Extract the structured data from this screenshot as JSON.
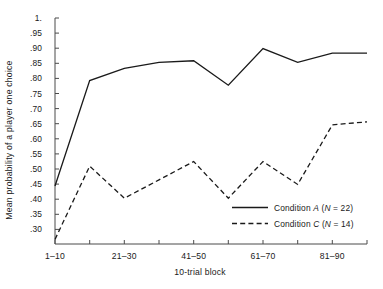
{
  "chart_data": {
    "type": "line",
    "title": "",
    "xlabel": "10-trial block",
    "ylabel": "Mean probability of a player one choice",
    "categories": [
      "1-10",
      "11-20",
      "21-30",
      "31-40",
      "41-50",
      "51-60",
      "61-70",
      "71-80",
      "81-90",
      "91-100"
    ],
    "x_tick_labels": [
      "1–10",
      "21–30",
      "41–50",
      "61–70",
      "81–90"
    ],
    "x_tick_label_indices": [
      0,
      2,
      4,
      6,
      8
    ],
    "y_tick_labels": [
      "1.",
      ".95",
      ".90",
      ".85",
      ".80",
      ".75",
      ".70",
      ".65",
      ".60",
      ".55",
      ".50",
      ".45",
      ".40",
      ".35",
      ".30"
    ],
    "y_tick_values": [
      1.0,
      0.95,
      0.9,
      0.85,
      0.8,
      0.75,
      0.7,
      0.65,
      0.6,
      0.55,
      0.5,
      0.45,
      0.4,
      0.35,
      0.3
    ],
    "ylim": [
      0.26,
      1.0
    ],
    "grid": false,
    "legend_position": "inside-lower-right",
    "series": [
      {
        "name": "Condition A (N = 22)",
        "legend_label_prefix": "Condition ",
        "legend_label_italic1": "A",
        "legend_label_mid": " (",
        "legend_label_italic2": "N",
        "legend_label_suffix": " = 22)",
        "style": "solid",
        "color": "#1a1a1a",
        "values": [
          0.45,
          0.795,
          0.835,
          0.855,
          0.86,
          0.78,
          0.9,
          0.855,
          0.885,
          0.885
        ]
      },
      {
        "name": "Condition C (N = 14)",
        "legend_label_prefix": "Condition ",
        "legend_label_italic1": "C",
        "legend_label_mid": " (",
        "legend_label_italic2": "N",
        "legend_label_suffix": " = 14)",
        "style": "dashed",
        "color": "#1a1a1a",
        "values": [
          0.275,
          0.515,
          0.41,
          0.47,
          0.53,
          0.41,
          0.53,
          0.455,
          0.65,
          0.66
        ]
      }
    ]
  },
  "axes": {
    "y_axis_label": "Mean probability of a player one choice",
    "x_axis_label": "10-trial block"
  }
}
